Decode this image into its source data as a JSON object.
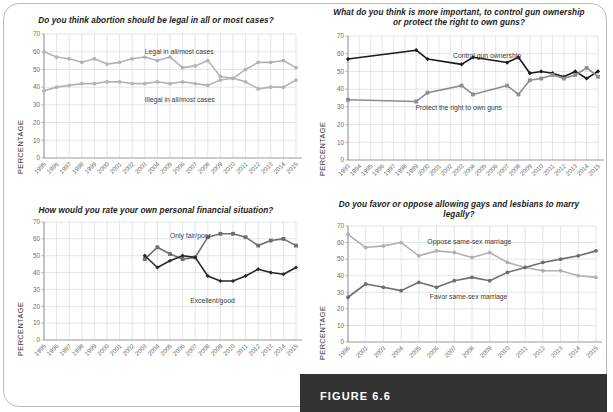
{
  "figure": {
    "label": "FIGURE 6.6",
    "bar_color": "#333333"
  },
  "axis": {
    "ylabel": "PERCENTAGE",
    "yticks": [
      0,
      10,
      20,
      30,
      40,
      50,
      60,
      70
    ],
    "ymin": 0,
    "ymax": 70
  },
  "colors": {
    "dark_series": "#1a1a1a",
    "mid_series": "#6e6e6e",
    "light_series": "#b4b4b4",
    "grid": "#c9cfd8",
    "axis": "#8a8a8a"
  },
  "chart_data": [
    {
      "id": "abortion",
      "type": "line",
      "title": "Do you think abortion should be legal in all or most cases?",
      "xlabel": "",
      "ylabel": "PERCENTAGE",
      "ylim": [
        0,
        70
      ],
      "grid": true,
      "legend": "inline-annotations",
      "categories": [
        "1995",
        "1996",
        "1997",
        "1998",
        "1999",
        "2000",
        "2001",
        "2002",
        "2003",
        "2004",
        "2005",
        "2006",
        "2007",
        "2008",
        "2009",
        "2010",
        "2011",
        "2012",
        "2013",
        "2014",
        "2015"
      ],
      "series": [
        {
          "name": "Legal in all/most cases",
          "color": "#b4b4b4",
          "marker": "circle",
          "values": [
            60,
            57,
            56,
            54,
            56,
            53,
            54,
            56,
            57,
            55,
            57,
            51,
            52,
            55,
            46,
            45,
            50,
            54,
            54,
            55,
            51
          ]
        },
        {
          "name": "Illegal in all/most cases",
          "color": "#b4b4b4",
          "marker": "circle",
          "values": [
            38,
            40,
            41,
            42,
            42,
            43,
            43,
            42,
            42,
            43,
            42,
            43,
            42,
            41,
            44,
            45,
            43,
            39,
            40,
            40,
            44
          ]
        }
      ]
    },
    {
      "id": "guns",
      "type": "line",
      "title": "What do you think is more important, to control gun ownership or protect the right to own guns?",
      "xlabel": "",
      "ylabel": "PERCENTAGE",
      "ylim": [
        0,
        70
      ],
      "grid": true,
      "legend": "inline-annotations",
      "categories": [
        "1993",
        "1994",
        "1995",
        "1996",
        "1997",
        "1998",
        "1999",
        "2000",
        "2001",
        "2002",
        "2003",
        "2004",
        "2005",
        "2006",
        "2007",
        "2008",
        "2009",
        "2010",
        "2011",
        "2012",
        "2013",
        "2014",
        "2015"
      ],
      "series": [
        {
          "name": "Control gun ownership",
          "color": "#1a1a1a",
          "marker": "diamond",
          "values": [
            57,
            null,
            null,
            null,
            null,
            null,
            62,
            57,
            null,
            null,
            54,
            58,
            null,
            null,
            55,
            58,
            49,
            50,
            49,
            47,
            50,
            46,
            50
          ]
        },
        {
          "name": "Protect the right to own guns",
          "color": "#8d8d8d",
          "marker": "square",
          "values": [
            34,
            null,
            null,
            null,
            null,
            null,
            33,
            38,
            null,
            null,
            42,
            37,
            null,
            null,
            42,
            37,
            45,
            46,
            48,
            46,
            48,
            52,
            47
          ]
        }
      ]
    },
    {
      "id": "finances",
      "type": "line",
      "title": "How would you rate your own personal financial situation?",
      "xlabel": "",
      "ylabel": "PERCENTAGE",
      "ylim": [
        0,
        70
      ],
      "grid": true,
      "legend": "inline-annotations",
      "categories": [
        "1995",
        "1996",
        "1997",
        "1998",
        "1999",
        "2000",
        "2001",
        "2002",
        "2003",
        "2004",
        "2005",
        "2006",
        "2007",
        "2008",
        "2009",
        "2010",
        "2011",
        "2012",
        "2013",
        "2014",
        "2015"
      ],
      "series": [
        {
          "name": "Only fair/poor",
          "color": "#6e6e6e",
          "marker": "square",
          "values": [
            null,
            null,
            null,
            null,
            null,
            null,
            null,
            null,
            48,
            55,
            51,
            48,
            49,
            61,
            63,
            63,
            61,
            56,
            59,
            60,
            56
          ]
        },
        {
          "name": "Excellent/good",
          "color": "#2a2a2a",
          "marker": "diamond",
          "values": [
            null,
            null,
            null,
            null,
            null,
            null,
            null,
            null,
            50,
            43,
            47,
            50,
            49,
            38,
            35,
            35,
            38,
            42,
            40,
            39,
            43
          ]
        }
      ]
    },
    {
      "id": "ssm",
      "type": "line",
      "title": "Do you favor or oppose allowing gays and lesbians to marry legally?",
      "xlabel": "",
      "ylabel": "PERCENTAGE",
      "ylim": [
        0,
        70
      ],
      "grid": true,
      "legend": "inline-annotations",
      "categories": [
        "1996",
        "2001",
        "2003",
        "2004",
        "2005",
        "2006",
        "2007",
        "2008",
        "2009",
        "2010",
        "2011",
        "2012",
        "2013",
        "2014",
        "2015"
      ],
      "series": [
        {
          "name": "Oppose same-sex marriage",
          "color": "#b0b0b0",
          "marker": "circle",
          "values": [
            65,
            57,
            58,
            60,
            52,
            55,
            54,
            51,
            54,
            48,
            45,
            43,
            43,
            40,
            39
          ]
        },
        {
          "name": "Favor same-sex marriage",
          "color": "#6e6e6e",
          "marker": "circle",
          "values": [
            27,
            35,
            33,
            31,
            36,
            33,
            37,
            39,
            37,
            42,
            45,
            48,
            50,
            52,
            55
          ]
        }
      ]
    }
  ]
}
